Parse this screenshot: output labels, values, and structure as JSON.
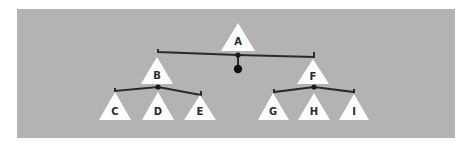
{
  "diagram": {
    "type": "mobile-balance-tree",
    "colors": {
      "background": "#b3b3b3",
      "node_fill": "#ffffff",
      "bar_stroke": "#2a2a2a",
      "label": "#2b2b2b"
    },
    "nodes": [
      {
        "id": "A",
        "label": "A",
        "apex": [
          238,
          23
        ],
        "base_left": [
          221,
          51
        ],
        "base_right": [
          255,
          51
        ]
      },
      {
        "id": "B",
        "label": "B",
        "apex": [
          157,
          57
        ],
        "base_left": [
          141,
          84
        ],
        "base_right": [
          173,
          84
        ]
      },
      {
        "id": "F",
        "label": "F",
        "apex": [
          313,
          59
        ],
        "base_left": [
          297,
          84
        ],
        "base_right": [
          329,
          84
        ]
      },
      {
        "id": "C",
        "label": "C",
        "apex": [
          115,
          92
        ],
        "base_left": [
          99,
          120
        ],
        "base_right": [
          131,
          120
        ]
      },
      {
        "id": "D",
        "label": "D",
        "apex": [
          158,
          92
        ],
        "base_left": [
          142,
          120
        ],
        "base_right": [
          174,
          120
        ]
      },
      {
        "id": "E",
        "label": "E",
        "apex": [
          200,
          95
        ],
        "base_left": [
          184,
          120
        ],
        "base_right": [
          216,
          120
        ]
      },
      {
        "id": "G",
        "label": "G",
        "apex": [
          273,
          93
        ],
        "base_left": [
          258,
          120
        ],
        "base_right": [
          289,
          120
        ]
      },
      {
        "id": "H",
        "label": "H",
        "apex": [
          314,
          93
        ],
        "base_left": [
          298,
          120
        ],
        "base_right": [
          330,
          120
        ]
      },
      {
        "id": "I",
        "label": "I",
        "apex": [
          354,
          94
        ],
        "base_left": [
          339,
          120
        ],
        "base_right": [
          369,
          120
        ]
      }
    ],
    "edges": [
      {
        "from": "A",
        "to": "B"
      },
      {
        "from": "A",
        "to": "F"
      },
      {
        "from": "B",
        "to": "C"
      },
      {
        "from": "B",
        "to": "D"
      },
      {
        "from": "B",
        "to": "E"
      },
      {
        "from": "F",
        "to": "G"
      },
      {
        "from": "F",
        "to": "H"
      },
      {
        "from": "F",
        "to": "I"
      }
    ],
    "pivots": [
      {
        "parent": "A",
        "center": [
          238,
          55
        ],
        "bar_left": [
          158,
          52
        ],
        "bar_right": [
          314,
          57
        ],
        "counterweight": [
          238,
          69
        ]
      },
      {
        "parent": "B",
        "center": [
          158,
          87
        ],
        "bar_left": [
          115,
          91
        ],
        "bar_right": [
          201,
          95
        ]
      },
      {
        "parent": "F",
        "center": [
          314,
          87
        ],
        "bar_left": [
          274,
          92
        ],
        "bar_right": [
          354,
          92
        ]
      }
    ]
  }
}
